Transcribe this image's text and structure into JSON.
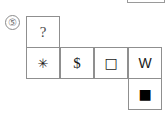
{
  "puzzle": {
    "item_number": "⑤",
    "type": "cube-net",
    "partial_box_label": "",
    "cells": [
      {
        "id": "top-unknown",
        "symbol": "?",
        "name": "question-mark",
        "row": 0,
        "col": 0
      },
      {
        "id": "mid-snowflake",
        "symbol": "✳",
        "name": "snowflake-asterisk",
        "row": 1,
        "col": 0
      },
      {
        "id": "mid-dollar",
        "symbol": "$",
        "name": "dollar-sign",
        "row": 1,
        "col": 1
      },
      {
        "id": "mid-hollow",
        "symbol": "□",
        "name": "hollow-square",
        "row": 1,
        "col": 2
      },
      {
        "id": "mid-w",
        "symbol": "W",
        "name": "letter-w",
        "row": 1,
        "col": 3
      },
      {
        "id": "bottom-filled",
        "symbol": "■",
        "name": "filled-square",
        "row": 2,
        "col": 3
      }
    ]
  },
  "colors": {
    "background": "#ffffff",
    "border": "#8f8f8f",
    "glyph": "#1a1a1a",
    "question_glyph": "#4a4a4a",
    "number_circle": "#8c8c8c"
  }
}
